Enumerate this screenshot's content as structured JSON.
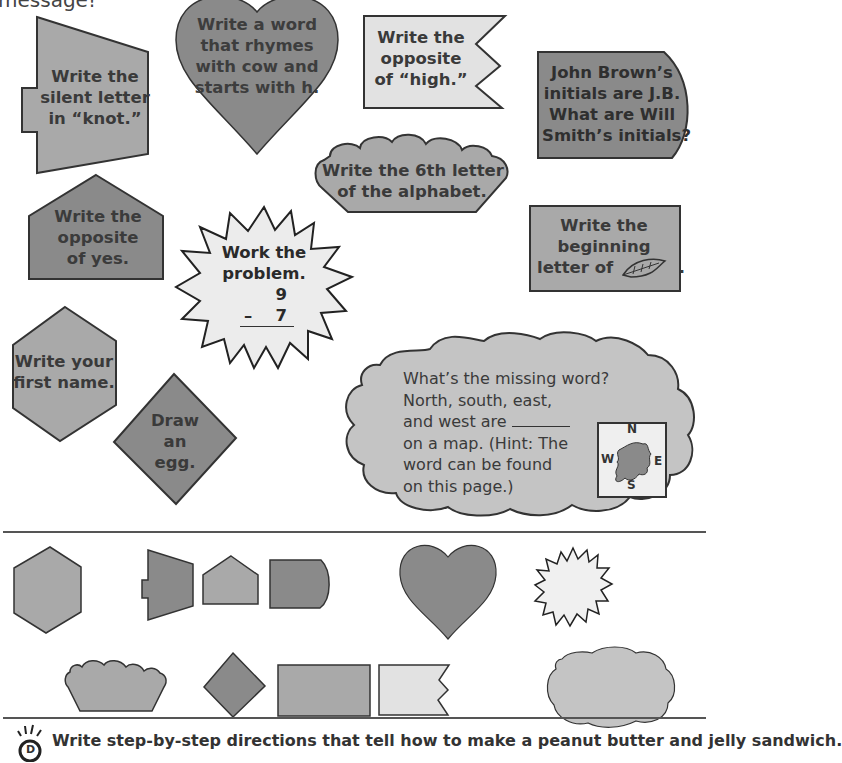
{
  "header": {
    "fragment": "message!"
  },
  "colors": {
    "dark_gray": "#8a8a8a",
    "medium_gray": "#a9a9a9",
    "light_gray": "#c9c9c9",
    "very_light_gray": "#e6e6e6",
    "outline": "#333333"
  },
  "shapes": [
    {
      "id": "trapezoid",
      "lines": [
        "Write the",
        "silent letter",
        "in “knot.”"
      ]
    },
    {
      "id": "heart",
      "lines": [
        "Write a word",
        "that rhymes",
        "with cow and",
        "starts with h."
      ]
    },
    {
      "id": "banner",
      "lines": [
        "Write the",
        "opposite",
        "of “high.”"
      ]
    },
    {
      "id": "half-round",
      "lines": [
        "John Brown’s",
        "initials are J.B.",
        "What are Will",
        "Smith’s initials?"
      ]
    },
    {
      "id": "scalloped-bowl",
      "lines": [
        "Write the 6th letter",
        "of the alphabet."
      ]
    },
    {
      "id": "pentagon",
      "lines": [
        "Write the",
        "opposite",
        "of yes."
      ]
    },
    {
      "id": "starburst",
      "lines": [
        "Work the",
        "problem."
      ],
      "problem": {
        "top": "9",
        "operator": "–",
        "bottom": "7"
      }
    },
    {
      "id": "rectangle",
      "lines": [
        "Write the",
        "beginning",
        "letter of"
      ],
      "suffix": ".",
      "icon": "leaf-icon"
    },
    {
      "id": "hexagon",
      "lines": [
        "Write your",
        "first name."
      ]
    },
    {
      "id": "diamond",
      "lines": [
        "Draw",
        "an",
        "egg."
      ]
    },
    {
      "id": "cloud",
      "lines": [
        "What’s the missing word?",
        "North, south, east,",
        "and west are",
        "on a map. (Hint: The",
        "word can be found",
        "on this page.)"
      ],
      "compass": {
        "n": "N",
        "s": "S",
        "e": "E",
        "w": "W"
      }
    }
  ],
  "answer_shapes": [
    "hexagon",
    "trapezoid",
    "pentagon",
    "half-round",
    "heart",
    "starburst",
    "scalloped-bowl",
    "diamond",
    "rectangle",
    "banner",
    "cloud"
  ],
  "footer": {
    "icon": "lightbulb-icon",
    "icon_letter": "D",
    "prompt": "Write step-by-step directions that tell how to make a peanut butter and jelly sandwich."
  }
}
